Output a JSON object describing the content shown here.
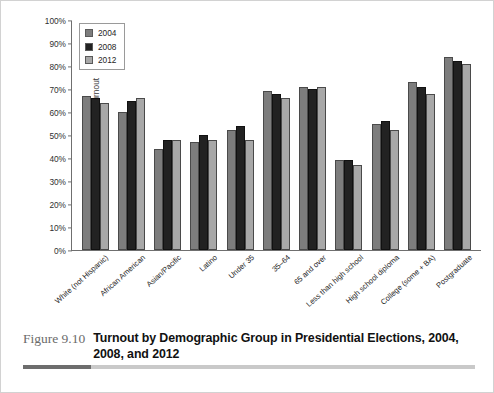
{
  "figure": {
    "number": "Figure 9.10",
    "title": "Turnout by Demographic Group in Presidential Elections, 2004, 2008, and 2012"
  },
  "legend": {
    "items": [
      {
        "label": "2004",
        "color": "#7d7d7d"
      },
      {
        "label": "2008",
        "color": "#222222"
      },
      {
        "label": "2012",
        "color": "#a8a8a8"
      }
    ]
  },
  "chart_data": {
    "type": "bar",
    "title": "Turnout by Demographic Group in Presidential Elections, 2004, 2008, and 2012",
    "xlabel": "",
    "ylabel": "Percentage turnout",
    "ylim": [
      0,
      100
    ],
    "ytick_labels": [
      "100%",
      "90%",
      "80%",
      "70%",
      "60%",
      "50%",
      "40%",
      "30%",
      "20%",
      "10%",
      "0%"
    ],
    "ytick_values": [
      100,
      90,
      80,
      70,
      60,
      50,
      40,
      30,
      20,
      10,
      0
    ],
    "grid": false,
    "legend_position": "top-left",
    "categories": [
      "White (not Hispanic)",
      "African American",
      "Asian/Pacific",
      "Latino",
      "Under 35",
      "35–64",
      "65 and over",
      "Less than high school",
      "High school diploma",
      "College (some + BA)",
      "Postgraduate"
    ],
    "series": [
      {
        "name": "2004",
        "color": "#7d7d7d",
        "values": [
          67,
          60,
          44,
          47,
          52,
          69,
          71,
          39,
          55,
          73,
          84
        ]
      },
      {
        "name": "2008",
        "color": "#222222",
        "values": [
          66,
          65,
          48,
          50,
          54,
          68,
          70,
          39,
          56,
          71,
          82
        ]
      },
      {
        "name": "2012",
        "color": "#a8a8a8",
        "values": [
          64,
          66,
          48,
          48,
          48,
          66,
          71,
          37,
          52,
          68,
          81
        ]
      }
    ]
  }
}
